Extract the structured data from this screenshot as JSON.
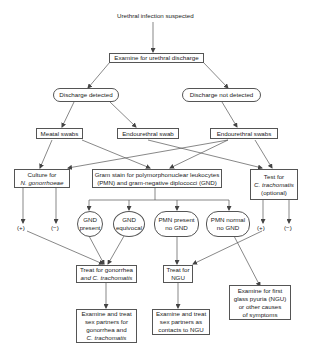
{
  "diagram": {
    "title": "Urethral infection suspected",
    "nodes": {
      "examine": "Examine for urethral discharge",
      "discharge_detected": "Discharge detected",
      "discharge_not_detected": "Discharge not detected",
      "meatal_swabs": "Meatal swabs",
      "endourethral_swab": "Endourethral swab",
      "endourethral_swabs": "Endourethral swabs",
      "culture": {
        "line1": "Culture for",
        "line2": "N. gonorrhoeae"
      },
      "gram_stain": {
        "line1": "Gram stain for polymorphonuclear leukocytes",
        "line2": "(PMN) and gram-negative diplococci (GND)"
      },
      "test_ct": {
        "line1": "Test for",
        "line2": "C. trachomatis",
        "line3": "(optional)"
      },
      "gnd_present": {
        "line1": "GND",
        "line2": "present"
      },
      "gnd_equivocal": {
        "line1": "GND",
        "line2": "equivocal"
      },
      "pmn_present": {
        "line1": "PMN present",
        "line2": "no GND"
      },
      "pmn_normal": {
        "line1": "PMN normal",
        "line2": "no GND"
      },
      "culture_pos": "(+)",
      "culture_neg": "(−)",
      "test_pos": "(+)",
      "test_neg": "(−)",
      "treat_gc_ct": {
        "line1": "Treat for gonorrhea",
        "line2": "and C. trachomatis"
      },
      "treat_ngu": {
        "line1": "Treat for",
        "line2": "NGU"
      },
      "partners_gc_ct": {
        "line1": "Examine and treat",
        "line2": "sex partners for",
        "line3": "gonorrhea and",
        "line4": "C. trachomatis"
      },
      "partners_ngu": {
        "line1": "Examine and treat",
        "line2": "sex partners as",
        "line3": "contacts to NGU"
      },
      "first_glass": {
        "line1": "Examine for first",
        "line2": "glass pyuria (NGU)",
        "line3": "or other causes",
        "line4": "of symptoms"
      }
    }
  }
}
